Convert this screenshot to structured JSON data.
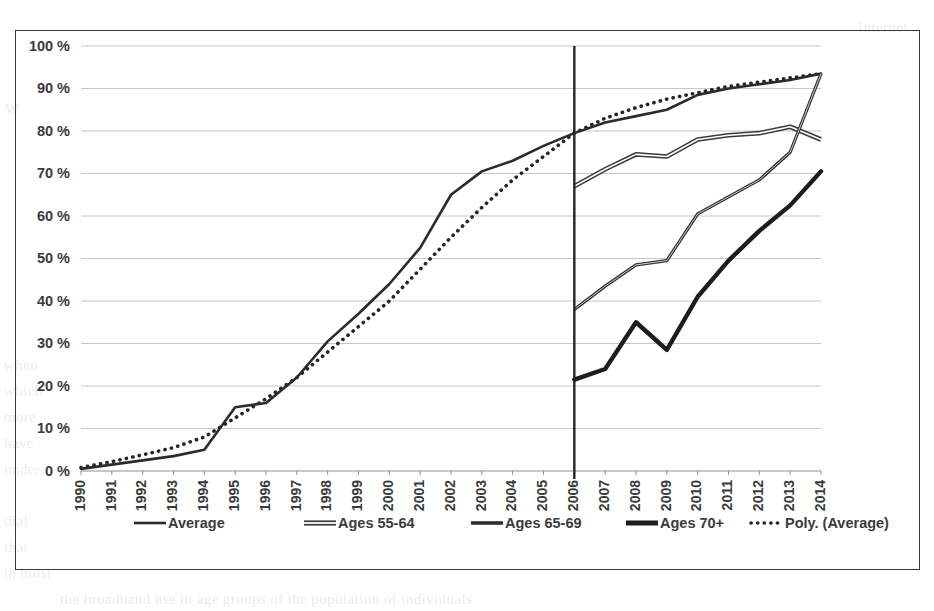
{
  "chart_data": {
    "type": "line",
    "title": "",
    "subtitle": "",
    "xlabel": "",
    "ylabel": "",
    "grid": "horizontal",
    "legend_position": "bottom",
    "categories": [
      "1990",
      "1991",
      "1992",
      "1993",
      "1994",
      "1995",
      "1996",
      "1997",
      "1998",
      "1999",
      "2000",
      "2001",
      "2002",
      "2003",
      "2004",
      "2005",
      "2006",
      "2007",
      "2008",
      "2009",
      "2010",
      "2011",
      "2012",
      "2013",
      "2014"
    ],
    "x": [
      1990,
      1991,
      1992,
      1993,
      1994,
      1995,
      1996,
      1997,
      1998,
      1999,
      2000,
      2001,
      2002,
      2003,
      2004,
      2005,
      2006,
      2007,
      2008,
      2009,
      2010,
      2011,
      2012,
      2013,
      2014
    ],
    "ylim": [
      0,
      100
    ],
    "yticks": [
      0,
      10,
      20,
      30,
      40,
      50,
      60,
      70,
      80,
      90,
      100
    ],
    "ytick_labels": [
      "0 %",
      "10 %",
      "20 %",
      "30 %",
      "40 %",
      "50 %",
      "60 %",
      "70 %",
      "80 %",
      "90 %",
      "100 %"
    ],
    "annotations": [
      {
        "name": "vertical-divider",
        "x": "2006",
        "note": "vertical reference line at year 2006"
      }
    ],
    "series": [
      {
        "name": "Average",
        "style": "solid-thin",
        "color": "#2b2b2b",
        "values": [
          0.5,
          1.5,
          2.5,
          3.5,
          5.0,
          15.0,
          16.0,
          22.0,
          30.5,
          37.0,
          44.0,
          52.5,
          65.0,
          70.5,
          73.0,
          76.5,
          79.5,
          82.0,
          83.5,
          85.0,
          88.5,
          90.0,
          91.0,
          92.0,
          93.5
        ]
      },
      {
        "name": "Ages 55-64",
        "style": "solid-hollow",
        "color": "#3a3a3a",
        "values": [
          null,
          null,
          null,
          null,
          null,
          null,
          null,
          null,
          null,
          null,
          null,
          null,
          null,
          null,
          null,
          null,
          67.0,
          71.0,
          74.5,
          74.0,
          78.0,
          79.0,
          79.5,
          81.0,
          78.0
        ]
      },
      {
        "name": "Ages 65-69",
        "style": "solid-medium",
        "color": "#2f2f2f",
        "values": [
          null,
          null,
          null,
          null,
          null,
          null,
          null,
          null,
          null,
          null,
          null,
          null,
          null,
          null,
          null,
          null,
          38.0,
          43.5,
          48.5,
          49.5,
          60.5,
          64.5,
          68.5,
          75.0,
          93.5
        ]
      },
      {
        "name": "Ages 70+",
        "style": "solid-thick",
        "color": "#1d1d1d",
        "values": [
          null,
          null,
          null,
          null,
          null,
          null,
          null,
          null,
          null,
          null,
          null,
          null,
          null,
          null,
          null,
          null,
          21.5,
          24.0,
          35.0,
          28.5,
          41.0,
          49.5,
          56.5,
          62.5,
          70.5
        ]
      },
      {
        "name": "Poly. (Average)",
        "style": "dotted",
        "color": "#262626",
        "trendline": true,
        "values": [
          0.8,
          2.2,
          3.8,
          5.5,
          8.0,
          12.5,
          17.0,
          22.0,
          28.0,
          34.0,
          40.0,
          47.5,
          55.0,
          62.0,
          68.5,
          74.0,
          79.5,
          83.0,
          85.5,
          87.5,
          89.0,
          90.5,
          91.5,
          92.5,
          93.5
        ]
      }
    ],
    "legend": [
      {
        "label": "Average",
        "swatch": "solid-thin",
        "color": "#2b2b2b"
      },
      {
        "label": "Ages 55-64",
        "swatch": "solid-hollow",
        "color": "#3a3a3a"
      },
      {
        "label": "Ages 65-69",
        "swatch": "solid-medium",
        "color": "#2f2f2f"
      },
      {
        "label": "Ages 70+",
        "swatch": "solid-thick",
        "color": "#1d1d1d"
      },
      {
        "label": "Poly. (Average)",
        "swatch": "dotted",
        "color": "#262626"
      }
    ]
  },
  "background_text": {
    "lines": [
      "Internet",
      "W",
      "when",
      "which",
      "more",
      "have",
      "under",
      "dial",
      "that",
      "in most",
      "the broadband use in age groups of the population of individuals"
    ]
  }
}
